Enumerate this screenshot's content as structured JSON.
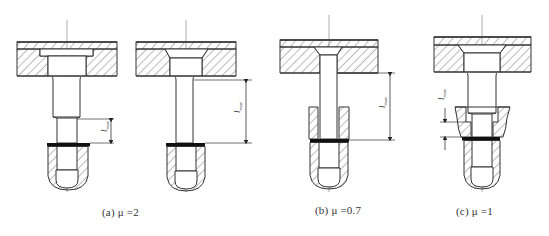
{
  "figure": {
    "background": "#ffffff",
    "line_color": "#333333",
    "hatch_color": "#555555",
    "bar_color": "#111111"
  },
  "subfigures": [
    {
      "id": "a1",
      "caption": "",
      "dimension_label": "l",
      "dimension_subscript": "max",
      "description": "counterbored plate, stepped rod, short free length"
    },
    {
      "id": "a2",
      "caption": "(a)  μ =2",
      "dimension_label": "l",
      "dimension_subscript": "max",
      "description": "countersunk plate, slender rod, long free length"
    },
    {
      "id": "b",
      "caption": "(b)  μ =0.7",
      "dimension_label": "l",
      "dimension_subscript": "max",
      "description": "countersunk plate, rod guided by sleeve"
    },
    {
      "id": "c",
      "caption": "(c)  μ =1",
      "dimension_label": "l",
      "dimension_subscript": "max",
      "description": "countersunk plate, stepped rod guided by chamfered sleeve"
    }
  ]
}
